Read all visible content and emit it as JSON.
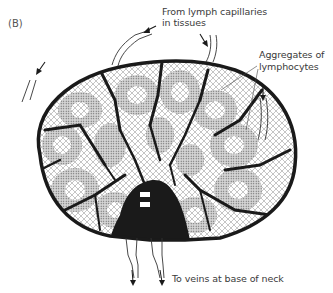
{
  "figure": {
    "panel_label": "(B)",
    "labels": {
      "afferent": [
        "From lymph capillaries",
        "in tissues"
      ],
      "aggregates": [
        "Aggregates of",
        "lymphocytes"
      ],
      "efferent": "To veins at base of neck"
    },
    "colors": {
      "outline": "#1a1a1a",
      "tissue_fill": "#bdbdbd",
      "follicle_fill": "#9a9a9a",
      "text": "#3a3a3a",
      "background": "#ffffff"
    }
  }
}
